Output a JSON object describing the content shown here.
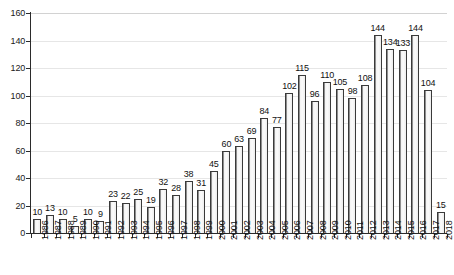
{
  "chart_data": {
    "type": "bar",
    "title": "",
    "xlabel": "",
    "ylabel": "",
    "ylim": [
      0,
      160
    ],
    "y_ticks": [
      0,
      20,
      40,
      60,
      80,
      100,
      120,
      140,
      160
    ],
    "grid": true,
    "legend": "none",
    "categories": [
      "1986",
      "1987",
      "1988",
      "1989",
      "1990",
      "1991",
      "1992",
      "1993",
      "1994",
      "1995",
      "1996",
      "1997",
      "1998",
      "1999",
      "2000",
      "2001",
      "2002",
      "2003",
      "2004",
      "2005",
      "2006",
      "2007",
      "2008",
      "2009",
      "2010",
      "2011",
      "2012",
      "2013",
      "2014",
      "2015",
      "2016",
      "2017",
      "2018"
    ],
    "values": [
      10,
      13,
      10,
      5,
      10,
      9,
      23,
      22,
      25,
      19,
      32,
      28,
      38,
      31,
      45,
      60,
      63,
      69,
      84,
      77,
      102,
      115,
      96,
      110,
      105,
      98,
      108,
      144,
      134,
      133,
      144,
      104,
      15
    ],
    "data_labels": [
      "10",
      "13",
      "10",
      "5",
      "10",
      "9",
      "23",
      "22",
      "25",
      "19",
      "32",
      "28",
      "38",
      "31",
      "45",
      "60",
      "63",
      "69",
      "84",
      "77",
      "102",
      "115",
      "96",
      "110",
      "105",
      "98",
      "108",
      "144",
      "134",
      "133",
      "144",
      "104",
      "15"
    ],
    "colors": {
      "bar_fill": "#f7f7f7",
      "bar_edge": "#3a3a3a",
      "gridline": "#e6e6e6",
      "axis": "#2b2b2b",
      "text": "#111111",
      "background": "#ffffff"
    }
  }
}
